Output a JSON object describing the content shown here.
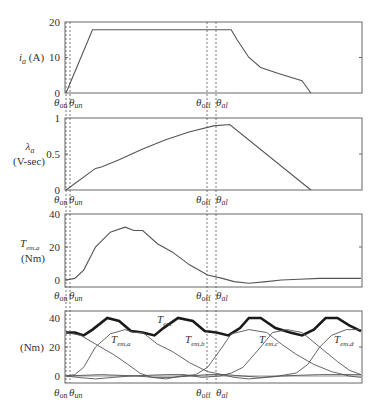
{
  "chart_data": [
    {
      "type": "line",
      "panel": 1,
      "ylabel": "i_a (A)",
      "ylabel_main": "i",
      "ylabel_sub": "a",
      "ylabel_unit": " (A)",
      "yticks": [
        0,
        10,
        20
      ],
      "ylim": [
        0,
        20
      ],
      "markers": [
        "θon",
        "θun",
        "θoff",
        "θal"
      ],
      "series": [
        {
          "name": "i_a",
          "x": [
            0,
            0.09,
            0.11,
            0.55,
            0.56,
            0.58,
            0.62,
            0.66,
            0.72,
            0.8,
            0.83
          ],
          "y": [
            0,
            17.8,
            17.8,
            17.8,
            17.8,
            15,
            10,
            7.2,
            5.5,
            3.5,
            0
          ]
        }
      ]
    },
    {
      "type": "line",
      "panel": 2,
      "ylabel": "λa (V-sec)",
      "ylabel_main": "λ",
      "ylabel_sub": "a",
      "ylabel_unit": "(V-sec)",
      "yticks": [
        0,
        0.5,
        1
      ],
      "ylim": [
        0,
        1
      ],
      "series": [
        {
          "name": "λa",
          "x": [
            0,
            0.1,
            0.12,
            0.18,
            0.26,
            0.34,
            0.42,
            0.5,
            0.555,
            0.83
          ],
          "y": [
            0,
            0.3,
            0.32,
            0.42,
            0.57,
            0.7,
            0.81,
            0.89,
            0.91,
            0
          ]
        }
      ]
    },
    {
      "type": "line",
      "panel": 3,
      "ylabel": "Tem,a (Nm)",
      "ylabel_main": "T",
      "ylabel_sub": "em,a",
      "ylabel_unit": "(Nm)",
      "yticks": [
        0,
        20,
        40
      ],
      "ylim": [
        -5,
        40
      ],
      "series": [
        {
          "name": "Tem,a",
          "x": [
            0,
            0.03,
            0.06,
            0.1,
            0.15,
            0.2,
            0.23,
            0.26,
            0.31,
            0.36,
            0.42,
            0.48,
            0.53,
            0.57,
            0.62,
            0.68,
            0.73,
            0.79,
            0.86,
            1.0
          ],
          "y": [
            0,
            1,
            6,
            20,
            29,
            32,
            30,
            30,
            22,
            17,
            9,
            3,
            1,
            -1,
            -2,
            -1,
            0,
            0.5,
            1,
            1
          ]
        }
      ]
    },
    {
      "type": "line",
      "panel": 4,
      "ylabel": "(Nm)",
      "yticks": [
        0,
        20,
        40
      ],
      "ylim": [
        -5,
        45
      ],
      "annotations": [
        "Tem",
        "Tem,a",
        "Tem,b",
        "Tem,c",
        "Tem,d"
      ],
      "series": [
        {
          "name": "Tem",
          "bold": true,
          "x": [
            0,
            0.03,
            0.06,
            0.09,
            0.14,
            0.18,
            0.22,
            0.26,
            0.3,
            0.33,
            0.38,
            0.43,
            0.47,
            0.51,
            0.55,
            0.59,
            0.62,
            0.66,
            0.71,
            0.76,
            0.8,
            0.84,
            0.88,
            0.92,
            0.96,
            1.0
          ],
          "y": [
            30,
            30,
            28,
            32,
            40,
            38,
            31,
            30,
            28,
            33,
            40,
            38,
            31,
            30,
            28,
            33,
            40,
            40,
            33,
            30,
            28,
            32,
            40,
            40,
            35,
            31
          ]
        },
        {
          "name": "Tem,a",
          "x": [
            0,
            0.03,
            0.06,
            0.1,
            0.15,
            0.2,
            0.23,
            0.26,
            0.31,
            0.36,
            0.42,
            0.48,
            0.53,
            0.57,
            0.62,
            0.68,
            0.73,
            0.79,
            0.86,
            1.0
          ],
          "y": [
            0,
            1,
            6,
            20,
            29,
            32,
            30,
            30,
            22,
            17,
            9,
            3,
            1,
            -1,
            -2,
            -1,
            0,
            0.5,
            1,
            1
          ]
        },
        {
          "name": "Tem,b",
          "x": [
            0,
            0.05,
            0.1,
            0.16,
            0.21,
            0.25,
            0.29,
            0.34,
            0.39,
            0.44,
            0.48,
            0.53,
            0.56,
            0.62,
            0.68,
            0.73,
            0.78,
            0.84,
            0.9,
            0.96,
            1.0
          ],
          "y": [
            30,
            28,
            22,
            15,
            8,
            2,
            -1,
            -2,
            0,
            1,
            6,
            20,
            29,
            32,
            30,
            22,
            15,
            8,
            3,
            0,
            -1
          ]
        },
        {
          "name": "Tem,c",
          "x": [
            0,
            0.04,
            0.1,
            0.16,
            0.22,
            0.28,
            0.34,
            0.4,
            0.46,
            0.52,
            0.56,
            0.6,
            0.66,
            0.7,
            0.75,
            0.8,
            0.86,
            0.92,
            0.96,
            1.0
          ],
          "y": [
            0,
            -1,
            -2,
            -1,
            0,
            0.5,
            1,
            1,
            -1,
            0,
            2,
            6,
            20,
            30,
            32,
            30,
            20,
            10,
            4,
            1
          ]
        },
        {
          "name": "Tem,d",
          "x": [
            0,
            0.06,
            0.12,
            0.18,
            0.24,
            0.3,
            0.36,
            0.42,
            0.48,
            0.54,
            0.6,
            0.66,
            0.72,
            0.78,
            0.82,
            0.86,
            0.9,
            0.95,
            1.0
          ],
          "y": [
            0,
            0.5,
            1,
            0.5,
            0,
            -1,
            -1,
            0,
            1,
            1,
            0,
            -1,
            0,
            2,
            8,
            20,
            28,
            32,
            32
          ]
        }
      ]
    }
  ],
  "panels": [
    {
      "ytick_labels": [
        "20",
        "10",
        "0"
      ],
      "ylabel_main": "i",
      "ylabel_sub": "a",
      "ylabel_unit": " (A)"
    },
    {
      "ytick_labels": [
        "1",
        "0.5",
        "0"
      ],
      "ylabel_main": "λ",
      "ylabel_sub": "a",
      "ylabel_unit": "(V-sec)"
    },
    {
      "ytick_labels": [
        "40",
        "20",
        "0"
      ],
      "ylabel_main": "T",
      "ylabel_sub": "em,a",
      "ylabel_unit": "(Nm)"
    },
    {
      "ytick_labels": [
        "40",
        "20",
        "0"
      ],
      "ylabel_unit": "(Nm)"
    }
  ],
  "theta_labels": {
    "on_main": "θ",
    "on_sub": "on",
    "un_main": "θ",
    "un_sub": "un",
    "off_main": "θ",
    "off_sub": "off",
    "al_main": "θ",
    "al_sub": "al"
  },
  "annotations": {
    "tem_main": "T",
    "tem_sub": "em",
    "tema_main": "T",
    "tema_sub": "em,a",
    "temb_main": "T",
    "temb_sub": "em,b",
    "temc_main": "T",
    "temc_sub": "em,c",
    "temd_main": "T",
    "temd_sub": "em,d"
  },
  "colors": {
    "line": "#555555",
    "bold_line": "#1a1a1a",
    "frame": "#555555",
    "text": "#333333"
  }
}
